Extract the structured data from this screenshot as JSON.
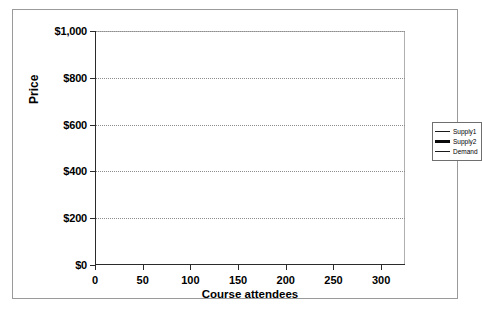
{
  "chart_data": {
    "type": "line",
    "title": "",
    "xlabel": "Course attendees",
    "ylabel": "Price",
    "xlim": [
      0,
      325
    ],
    "ylim": [
      0,
      1000
    ],
    "grid": true,
    "grid_axis": "y",
    "legend_position": "right",
    "x_ticks": [
      0,
      50,
      100,
      150,
      200,
      250,
      300
    ],
    "x_tick_labels": [
      "0",
      "50",
      "100",
      "150",
      "200",
      "250",
      "300"
    ],
    "y_ticks": [
      0,
      200,
      400,
      600,
      800,
      1000
    ],
    "y_tick_labels": [
      "$0",
      "$200",
      "$400",
      "$600",
      "$800",
      "$1,000"
    ],
    "series": [
      {
        "name": "Supply1",
        "color": "#1a1a1a",
        "width": 1.3,
        "points": [
          [
            100,
            200
          ],
          [
            250,
            700
          ]
        ]
      },
      {
        "name": "Supply2",
        "color": "#0a0a0a",
        "width": 3.2,
        "points": [
          [
            75,
            300
          ],
          [
            225,
            775
          ]
        ]
      },
      {
        "name": "Demand",
        "color": "#1a1a1a",
        "width": 1.3,
        "points": [
          [
            50,
            700
          ],
          [
            200,
            200
          ]
        ]
      }
    ]
  },
  "legend": {
    "items": [
      {
        "label": "Supply1",
        "color": "#1a1a1a",
        "width": 1.6
      },
      {
        "label": "Supply2",
        "color": "#0a0a0a",
        "width": 3.2
      },
      {
        "label": "Demand",
        "color": "#1a1a1a",
        "width": 1
      }
    ]
  }
}
